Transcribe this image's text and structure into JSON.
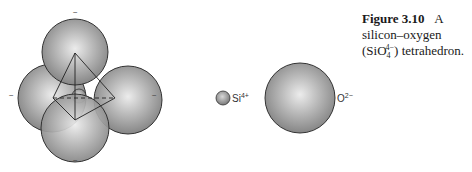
{
  "figure": {
    "number_label": "Figure 3.10",
    "title_word": "A",
    "line2": "silicon–oxygen",
    "formula_open": "(SiO",
    "formula_sub": "4",
    "formula_sup": "4−",
    "formula_close": ") tetrahedron."
  },
  "tetrahedron": {
    "charges": [
      "−",
      "−",
      "−",
      "−"
    ]
  },
  "ions": {
    "silicon": {
      "symbol": "Si",
      "charge": "4+"
    },
    "oxygen": {
      "symbol": "O",
      "charge": "2−"
    }
  },
  "colors": {
    "sphere_light": "#e6e6e6",
    "sphere_mid": "#a8a8a8",
    "sphere_dark": "#7a7a7a",
    "outline": "#333333"
  }
}
